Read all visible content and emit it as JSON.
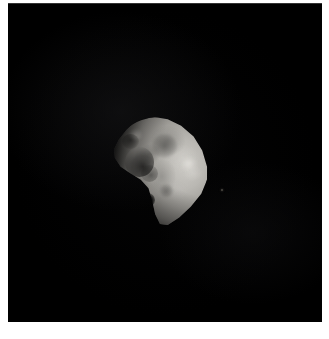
{
  "image": {
    "subject": "irregular natural satellite",
    "caption": "",
    "title": "",
    "medium": "grayscale spacecraft photograph",
    "background_color": "#000000",
    "border_color": "#ffffff",
    "body_color_bright": "#cdcbc6",
    "body_color_mid": "#9c9a95",
    "body_color_shadow": "#1a1a19",
    "star_color": "#5c5850"
  },
  "frame": {
    "margin_left_px": 8,
    "margin_top_px": 3,
    "margin_right_px": 7,
    "margin_bottom_px": 17,
    "plate_width_px": 314,
    "plate_height_px": 319
  },
  "body": {
    "label": "moon",
    "left_px": 112,
    "top_px": 117,
    "width_px": 96,
    "height_px": 108,
    "illumination_direction": "from the right",
    "terminator_side": "left"
  },
  "features": [
    {
      "name": "crater-cluster-upper-left",
      "kind": "shadowed crater cluster"
    },
    {
      "name": "crater-upper-rim",
      "kind": "crater"
    },
    {
      "name": "crater-upper-bright-rim",
      "kind": "bright crater rim"
    },
    {
      "name": "crater-mid-dark",
      "kind": "dark mottled terrain"
    },
    {
      "name": "crater-center-left",
      "kind": "crater"
    },
    {
      "name": "crater-lower-left-shadow",
      "kind": "deeply shadowed crater"
    },
    {
      "name": "crater-right-bright",
      "kind": "bright fresh crater"
    },
    {
      "name": "crater-lower-mid",
      "kind": "crater"
    },
    {
      "name": "background-star",
      "kind": "faint point source"
    }
  ]
}
